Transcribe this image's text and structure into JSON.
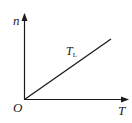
{
  "diagram": {
    "y_axis_label": "n",
    "x_axis_label": "T",
    "origin_label": "O",
    "line_label_main": "T",
    "line_label_sub": "L",
    "line_color": "#1a1a1a",
    "axis_color": "#1a1a1a"
  }
}
